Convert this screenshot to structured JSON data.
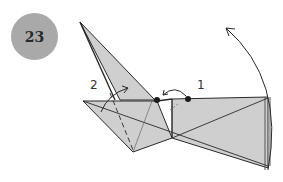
{
  "step": {
    "number": "23"
  },
  "labels": {
    "one": "1",
    "two": "2"
  },
  "colors": {
    "paper": "#cfcfcf",
    "line": "#2a2a2a",
    "badge": "#a9a9a9"
  }
}
